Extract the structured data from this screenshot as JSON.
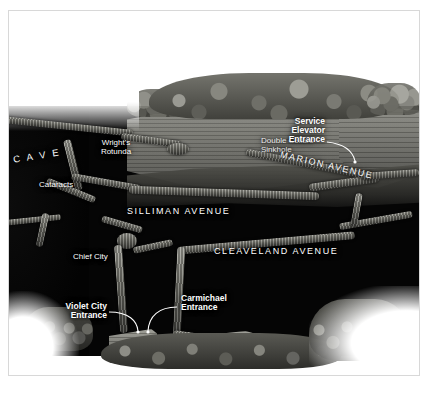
{
  "illustration": {
    "kind": "cutaway-cave-map",
    "subject": "Mammoth Cave passage cutaway illustration",
    "background_color": "#ffffff",
    "cave_void_color": "#050505",
    "label_color": "#ffffff",
    "frame_border_color": "#d8d8d8"
  },
  "labels": {
    "cave": "C A V E",
    "wrights_rotunda": "Wright's\nRotunda",
    "cataracts": "Cataracts",
    "double_cellars_sinkhole": "Double Cellars\nSinkhole",
    "service_elevator_entrance": "Service\nElevator\nEntrance",
    "marion_avenue": "MARION AVENUE",
    "silliman_avenue": "SILLIMAN AVENUE",
    "cleaveland_avenue": "CLEAVELAND AVENUE",
    "chief_city": "Chief City",
    "violet_city_entrance": "Violet City\nEntrance",
    "carmichael_entrance": "Carmichael\nEntrance"
  },
  "features": {
    "surface_terrain": "cut-away stratified terrain block",
    "tree_canopy": "forest canopy on surface",
    "rubble": "rock and tree rubble along base",
    "entrance_structures": [
      "Violet City entrance building",
      "Carmichael entrance shelter"
    ]
  }
}
